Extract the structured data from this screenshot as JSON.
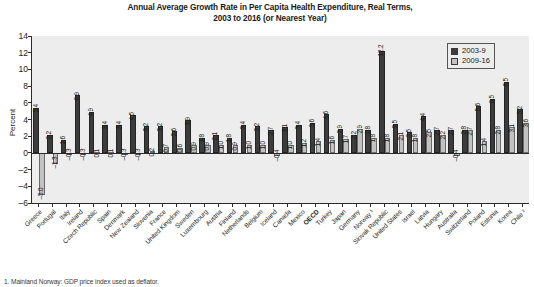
{
  "chart_data": {
    "type": "bar",
    "title": "Annual Average Growth Rate in Per Capita Health Expenditure, Real Terms, 2003 to 2016 (or Nearest Year)",
    "title_line1": "Annual Average Growth Rate in Per Capita Health Expenditure, Real Terms,",
    "title_line2": "2003 to 2016 (or Nearest Year)",
    "xlabel": "",
    "ylabel": "Percent",
    "ylim": [
      -6,
      14
    ],
    "yticks": [
      14,
      12,
      10,
      8,
      6,
      4,
      2,
      0,
      -2,
      -4,
      -6
    ],
    "grid": false,
    "legend_position": "top-right",
    "categories": [
      "Greece",
      "Portugal",
      "Italy",
      "Ireland",
      "Czech Republic",
      "Spain",
      "Denmark",
      "New Zealand",
      "Slovenia",
      "France",
      "United Kingdom",
      "Sweden",
      "Luxembourg",
      "Austria",
      "Finland",
      "Netherlands",
      "Belgium",
      "Iceland",
      "Canada",
      "Mexico",
      "OECD",
      "Turkey",
      "Japan",
      "Germany",
      "Norway ¹",
      "Slovak Republic",
      "United States",
      "Israel",
      "Latvia",
      "Hungary",
      "Australia",
      "Switzerland",
      "Poland",
      "Estonia",
      "Korea",
      "Chile ²"
    ],
    "bold_categories": [
      "OECD"
    ],
    "series": [
      {
        "name": "2003-9",
        "color": "#3c3c3c",
        "values": [
          5.4,
          2.2,
          1.6,
          6.9,
          4.9,
          3.4,
          3.4,
          4.5,
          3.2,
          3.2,
          2.6,
          3.9,
          1.8,
          2.1,
          1.8,
          3.4,
          3.2,
          2.7,
          3.1,
          3.4,
          3.6,
          4.6,
          2.9,
          2.2,
          2.8,
          12.2,
          3.5,
          2.5,
          4.4,
          2.7,
          2.7,
          2.8,
          5.6,
          6.5,
          8.5,
          5.2
        ],
        "labels": [
          "5.4",
          "2.2",
          "1.6",
          "6.9",
          "4.9",
          "3.4",
          "3.4",
          "4.5",
          "3.2",
          "3.2",
          "2.6",
          "3.9",
          "1.8",
          "2.1",
          "1.8",
          "3.4",
          "3.2",
          "2.7",
          "3.1",
          "3.4",
          "3.6",
          "4.6",
          "2.9",
          "2.2",
          "2.8",
          "12.2",
          "3.5",
          "2.5",
          "4.4",
          "2.7",
          "2.7",
          "2.8",
          "5.6",
          "6.5",
          "8.5",
          "5.2"
        ]
      },
      {
        "name": "2009-16",
        "color": "#c2c2c2",
        "values": [
          -5.0,
          -1.3,
          -0.3,
          -0.3,
          0.1,
          0.1,
          -0.3,
          -0.3,
          0.2,
          0.7,
          0.6,
          0.9,
          0.9,
          1.0,
          0.9,
          1.0,
          1.0,
          -0.4,
          1.0,
          1.2,
          1.4,
          1.6,
          1.7,
          2.9,
          1.8,
          1.8,
          2.1,
          1.8,
          2.5,
          2.2,
          -0.4,
          2.7,
          1.4,
          2.8,
          3.1,
          3.6
        ],
        "labels": [
          "-5.0",
          "-1.3",
          "-0.3",
          "-0.3",
          "0.1",
          "0.1",
          "-0.3",
          "-0.3",
          "0.2",
          "0.7",
          "0.6",
          "0.9",
          "0.9",
          "1.0",
          "0.9",
          "1.0",
          "1.0",
          "-0.4",
          "1.0",
          "1.2",
          "1.4",
          "1.6",
          "1.7",
          "2.9",
          "1.8",
          "1.8",
          "2.1",
          "1.8",
          "2.5",
          "2.2",
          "-0.4",
          "2.7",
          "1.4",
          "2.8",
          "3.1",
          "3.6"
        ]
      }
    ]
  },
  "legend": {
    "items": [
      {
        "label": "2003-9",
        "swatch": "dark"
      },
      {
        "label": "2009-16",
        "swatch": "light"
      }
    ]
  },
  "footnote": {
    "text": "1. Mainland Norway: GDP price index used as deflator."
  }
}
